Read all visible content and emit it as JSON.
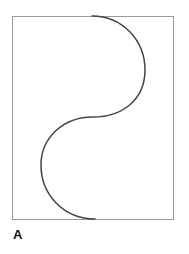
{
  "figure": {
    "panel_label": "A",
    "frame": {
      "x": 12.5,
      "y": 16.5,
      "width": 161,
      "height": 203,
      "stroke": "#9a9a9a"
    },
    "curve": {
      "shape": "s-curve",
      "stroke": "#444444",
      "start": [
        92,
        16
      ],
      "upper_arc_extreme": [
        145,
        70
      ],
      "midpoint": [
        93,
        117
      ],
      "lower_arc_extreme": [
        41,
        165
      ],
      "end": [
        95,
        219
      ]
    }
  }
}
